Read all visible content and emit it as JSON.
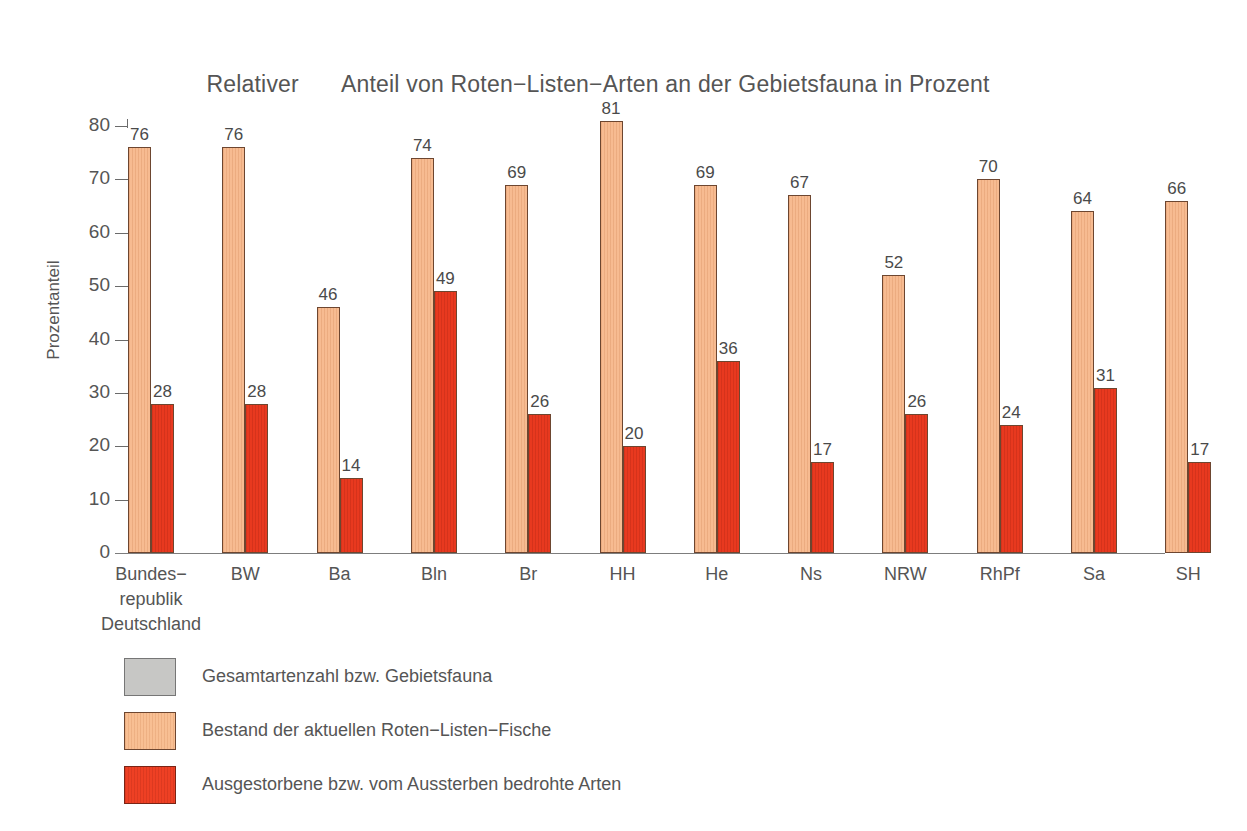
{
  "chart_data": {
    "type": "bar",
    "title_parts": {
      "lead": "Relativer",
      "rest": "Anteil von Roten−Listen−Arten an der Gebietsfauna in Prozent"
    },
    "xlabel": "",
    "ylabel": "Prozentanteil",
    "ylim": [
      0,
      80
    ],
    "yticks": [
      0,
      10,
      20,
      30,
      40,
      50,
      60,
      70,
      80
    ],
    "grid": false,
    "legend_position": "below-left",
    "categories": [
      "Bundes−\nrepublik\nDeutschland",
      "BW",
      "Ba",
      "Bln",
      "Br",
      "HH",
      "He",
      "Ns",
      "NRW",
      "RhPf",
      "Sa",
      "SH"
    ],
    "series": [
      {
        "name": "Bestand der aktuellen Roten−Listen−Fische",
        "color": "#f7bb91",
        "values": [
          76,
          76,
          46,
          74,
          69,
          81,
          69,
          67,
          52,
          70,
          64,
          66
        ]
      },
      {
        "name": "Ausgestorbene bzw. vom Aussterben bedrohte Arten",
        "color": "#e8391f",
        "values": [
          28,
          28,
          14,
          49,
          26,
          20,
          36,
          17,
          26,
          24,
          31,
          17
        ]
      }
    ],
    "legend_entries": [
      {
        "label": "Gesamtartenzahl bzw. Gebietsfauna",
        "color": "#c7c7c5",
        "swatch": "gray"
      },
      {
        "label": "Bestand der aktuellen Roten−Listen−Fische",
        "color": "#f8bf93",
        "swatch": "light"
      },
      {
        "label": "Ausgestorbene bzw. vom Aussterben bedrohte Arten",
        "color": "#ee4024",
        "swatch": "red"
      }
    ]
  }
}
